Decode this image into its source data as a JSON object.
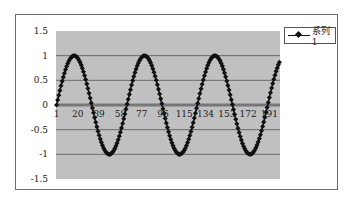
{
  "chart_data": {
    "type": "line",
    "title": "",
    "xlabel": "",
    "ylabel": "",
    "series": [
      {
        "name": "系列1",
        "function": "sin(0.1*(x-1))",
        "x_start": 1,
        "x_end": 200,
        "marker": "diamond",
        "color": "#111111"
      }
    ],
    "x_tick_labels": [
      "1",
      "20",
      "39",
      "58",
      "77",
      "96",
      "115",
      "134",
      "153",
      "172",
      "191"
    ],
    "y_tick_labels": [
      "1.5",
      "1",
      "0.5",
      "0",
      "-0.5",
      "-1",
      "-1.5"
    ],
    "y_ticks": [
      1.5,
      1,
      0.5,
      0,
      -0.5,
      -1,
      -1.5
    ],
    "ylim": [
      -1.5,
      1.5
    ],
    "xlim": [
      1,
      200
    ],
    "grid": true,
    "legend": {
      "position": "top-right",
      "entries": [
        "系列1"
      ]
    },
    "colors": {
      "plot_background": "#c0c0c0",
      "gridline": "#6a6a6a",
      "zero_line": "#777777",
      "series": "#111111"
    }
  }
}
